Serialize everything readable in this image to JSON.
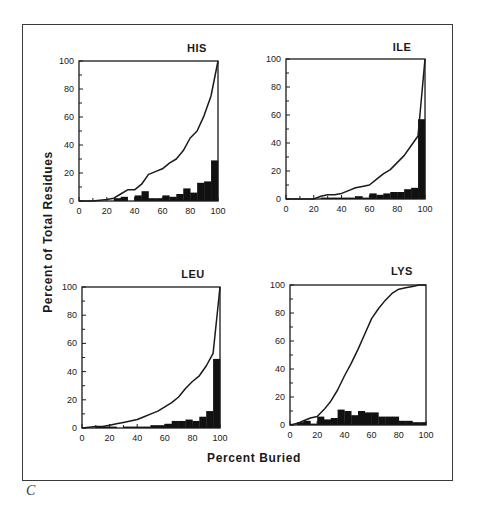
{
  "figure": {
    "panel_letter": "C",
    "ylabel": "Percent of Total Residues",
    "xlabel": "Percent Buried"
  },
  "chart_data": [
    {
      "type": "bar+line",
      "title": "HIS",
      "xlabel": "Percent Buried",
      "ylabel": "Percent of Total Residues",
      "xlim": [
        0,
        100
      ],
      "ylim": [
        0,
        100
      ],
      "xticks": [
        0,
        20,
        40,
        60,
        80,
        100
      ],
      "yticks": [
        0,
        20,
        40,
        60,
        80,
        100
      ],
      "grid": false,
      "histogram": {
        "bin_width": 5,
        "bin_starts": [
          0,
          5,
          10,
          15,
          20,
          25,
          30,
          35,
          40,
          45,
          50,
          55,
          60,
          65,
          70,
          75,
          80,
          85,
          90,
          95
        ],
        "values": [
          0,
          0,
          0,
          0,
          0,
          2,
          3,
          0,
          4,
          7,
          2,
          2,
          4,
          3,
          5,
          9,
          6,
          13,
          14,
          29
        ]
      },
      "cumulative_line": {
        "x": [
          0,
          10,
          20,
          25,
          30,
          35,
          40,
          45,
          50,
          55,
          60,
          65,
          70,
          75,
          80,
          85,
          90,
          95,
          100
        ],
        "y": [
          0,
          0,
          1,
          2,
          5,
          8,
          8,
          12,
          19,
          21,
          23,
          27,
          30,
          36,
          45,
          50,
          61,
          75,
          100
        ]
      }
    },
    {
      "type": "bar+line",
      "title": "ILE",
      "xlabel": "Percent Buried",
      "ylabel": "Percent of Total Residues",
      "xlim": [
        0,
        100
      ],
      "ylim": [
        0,
        100
      ],
      "xticks": [
        0,
        20,
        40,
        60,
        80,
        100
      ],
      "yticks": [
        0,
        20,
        40,
        60,
        80,
        100
      ],
      "grid": false,
      "histogram": {
        "bin_width": 5,
        "bin_starts": [
          0,
          5,
          10,
          15,
          20,
          25,
          30,
          35,
          40,
          45,
          50,
          55,
          60,
          65,
          70,
          75,
          80,
          85,
          90,
          95
        ],
        "values": [
          0,
          0,
          0,
          0,
          0,
          1,
          1,
          1,
          1,
          1,
          2,
          1,
          4,
          3,
          4,
          5,
          5,
          7,
          8,
          57
        ]
      },
      "cumulative_line": {
        "x": [
          0,
          20,
          25,
          30,
          35,
          40,
          45,
          50,
          55,
          60,
          65,
          70,
          75,
          80,
          85,
          90,
          95,
          100
        ],
        "y": [
          0,
          0,
          2,
          3,
          3,
          4,
          6,
          8,
          9,
          10,
          14,
          18,
          21,
          26,
          31,
          38,
          45,
          100
        ]
      }
    },
    {
      "type": "bar+line",
      "title": "LEU",
      "xlabel": "Percent Buried",
      "ylabel": "Percent of Total Residues",
      "xlim": [
        0,
        100
      ],
      "ylim": [
        0,
        100
      ],
      "xticks": [
        0,
        20,
        40,
        60,
        80,
        100
      ],
      "yticks": [
        0,
        20,
        40,
        60,
        80,
        100
      ],
      "grid": false,
      "histogram": {
        "bin_width": 5,
        "bin_starts": [
          0,
          5,
          10,
          15,
          20,
          25,
          30,
          35,
          40,
          45,
          50,
          55,
          60,
          65,
          70,
          75,
          80,
          85,
          90,
          95
        ],
        "values": [
          0,
          0,
          1,
          1,
          1,
          0,
          1,
          1,
          1,
          1,
          2,
          2,
          3,
          5,
          5,
          6,
          5,
          8,
          12,
          49
        ]
      },
      "cumulative_line": {
        "x": [
          0,
          10,
          15,
          20,
          25,
          30,
          35,
          40,
          45,
          50,
          55,
          60,
          65,
          70,
          75,
          80,
          85,
          90,
          95,
          100
        ],
        "y": [
          0,
          1,
          1,
          2,
          3,
          4,
          5,
          6,
          8,
          10,
          12,
          15,
          18,
          22,
          28,
          33,
          37,
          44,
          53,
          100
        ]
      }
    },
    {
      "type": "bar+line",
      "title": "LYS",
      "xlabel": "Percent Buried",
      "ylabel": "Percent of Total Residues",
      "xlim": [
        0,
        100
      ],
      "ylim": [
        0,
        100
      ],
      "xticks": [
        0,
        20,
        40,
        60,
        80,
        100
      ],
      "yticks": [
        0,
        20,
        40,
        60,
        80,
        100
      ],
      "grid": false,
      "histogram": {
        "bin_width": 5,
        "bin_starts": [
          0,
          5,
          10,
          15,
          20,
          25,
          30,
          35,
          40,
          45,
          50,
          55,
          60,
          65,
          70,
          75,
          80,
          85,
          90,
          95
        ],
        "values": [
          0,
          2,
          3,
          1,
          6,
          4,
          5,
          11,
          10,
          7,
          10,
          9,
          9,
          6,
          6,
          6,
          3,
          3,
          2,
          2
        ]
      },
      "cumulative_line": {
        "x": [
          0,
          5,
          10,
          15,
          20,
          25,
          30,
          35,
          40,
          45,
          50,
          55,
          60,
          65,
          70,
          75,
          80,
          85,
          90,
          95,
          100
        ],
        "y": [
          0,
          1,
          3,
          5,
          6,
          11,
          17,
          25,
          35,
          44,
          54,
          65,
          76,
          83,
          89,
          94,
          97,
          98,
          99,
          100,
          100
        ]
      }
    }
  ],
  "panels_layout": [
    {
      "title_x": 197,
      "title_y": 52,
      "x0": 79,
      "y0": 61,
      "x1": 218,
      "y1": 201
    },
    {
      "title_x": 402,
      "title_y": 51,
      "x0": 286,
      "y0": 59,
      "x1": 425,
      "y1": 199
    },
    {
      "title_x": 193,
      "title_y": 278,
      "x0": 82,
      "y0": 287,
      "x1": 220,
      "y1": 428
    },
    {
      "title_x": 402,
      "title_y": 275,
      "x0": 290,
      "y0": 285,
      "x1": 426,
      "y1": 425
    }
  ],
  "colors": {
    "ink": "#1a1a1a",
    "bars": "#111111",
    "frame": "#3a3a3a",
    "background": "#ffffff"
  }
}
